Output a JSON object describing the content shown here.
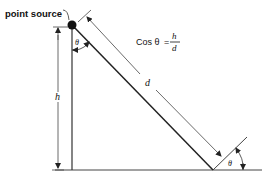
{
  "diagram": {
    "source_label": "point source",
    "formula": {
      "lhs": "Cos θ",
      "equals": "=",
      "numerator": "h",
      "denominator": "d"
    },
    "labels": {
      "height": "h",
      "distance": "d",
      "angle_top": "θ",
      "angle_bottom": "θ"
    },
    "colors": {
      "stroke": "#222222",
      "thin_stroke": "#555555",
      "background": "#ffffff"
    }
  }
}
